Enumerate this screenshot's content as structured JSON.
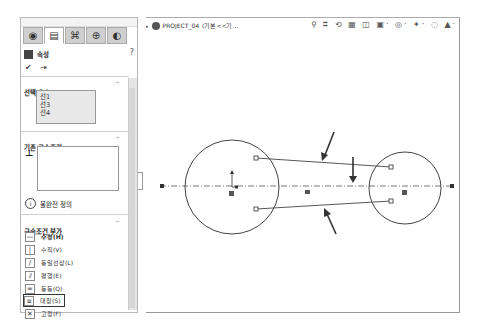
{
  "panel": {
    "tabs": [
      {
        "icon": "feature-manager-icon",
        "glyph": "◉"
      },
      {
        "icon": "property-manager-icon",
        "glyph": "▤",
        "active": true
      },
      {
        "icon": "configuration-manager-icon",
        "glyph": "⌘"
      },
      {
        "icon": "dimxpert-icon",
        "glyph": "⊕"
      },
      {
        "icon": "display-manager-icon",
        "glyph": "◐"
      }
    ],
    "title": "속성",
    "help_glyph": "?",
    "ok_glyph": "✔",
    "pin_glyph": "⇥",
    "selected_entities": {
      "title": "선택 요소",
      "items": [
        "선1",
        "선3",
        "선4"
      ]
    },
    "existing_relations": {
      "title": "기존 구속조건",
      "status_glyph": "i",
      "status_text": "불완전 정의"
    },
    "add_relations": {
      "title": "구속조건 부가",
      "items": [
        {
          "label": "수평(H)",
          "glyph": "—",
          "bold": true
        },
        {
          "label": "수직(V)",
          "glyph": "|"
        },
        {
          "label": "동일선상(L)",
          "glyph": "/"
        },
        {
          "label": "평행(E)",
          "glyph": "⫽"
        },
        {
          "label": "동등(Q)",
          "glyph": "="
        },
        {
          "label": "대칭(S)",
          "glyph": "⧈",
          "highlighted": true
        },
        {
          "label": "고정(F)",
          "glyph": "✕"
        }
      ]
    },
    "collapse_glyph": "^"
  },
  "graphics": {
    "breadcrumb": {
      "arrow": "▸",
      "document": "PROJECT_04",
      "config": "(기본<<기..."
    },
    "heads_up_toolbar": "⚲ ⌗ ⟲ ▦ ◫ ▣· ◎· ✦· ◌ ▲·"
  }
}
